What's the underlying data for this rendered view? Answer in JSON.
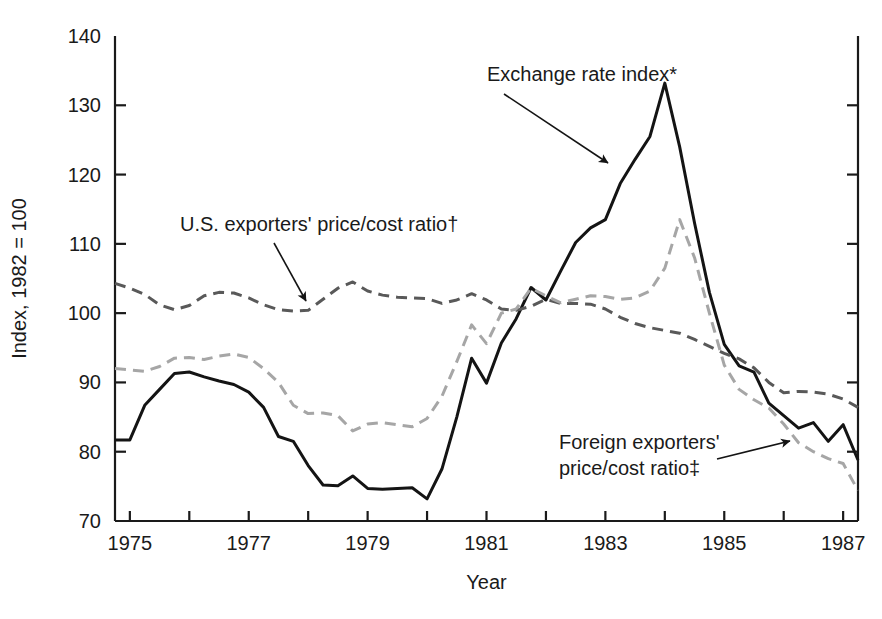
{
  "chart_data": {
    "type": "line",
    "title": "",
    "xlabel": "Year",
    "ylabel": "Index, 1982 = 100",
    "xlim": [
      1974.75,
      1987.25
    ],
    "ylim": [
      70,
      140
    ],
    "ytick_labels": [
      "140",
      "130",
      "120",
      "110",
      "100",
      "90",
      "80",
      "70"
    ],
    "ytick_values": [
      140,
      130,
      120,
      110,
      100,
      90,
      80,
      70
    ],
    "xtick_labels": [
      "1975",
      "1977",
      "1979",
      "1981",
      "1983",
      "1985",
      "1987"
    ],
    "xtick_values": [
      1975,
      1977,
      1979,
      1981,
      1983,
      1985,
      1987
    ],
    "xtick_minor_values": [
      1976,
      1978,
      1980,
      1982,
      1984,
      1986
    ],
    "grid": false,
    "legend_position": "annotations",
    "x": [
      1974.75,
      1975.0,
      1975.25,
      1975.5,
      1975.75,
      1976.0,
      1976.25,
      1976.5,
      1976.75,
      1977.0,
      1977.25,
      1977.5,
      1977.75,
      1978.0,
      1978.25,
      1978.5,
      1978.75,
      1979.0,
      1979.25,
      1979.5,
      1979.75,
      1980.0,
      1980.25,
      1980.5,
      1980.75,
      1981.0,
      1981.25,
      1981.5,
      1981.75,
      1982.0,
      1982.25,
      1982.5,
      1982.75,
      1983.0,
      1983.25,
      1983.5,
      1983.75,
      1984.0,
      1984.25,
      1984.5,
      1984.75,
      1985.0,
      1985.25,
      1985.5,
      1985.75,
      1986.0,
      1986.25,
      1986.5,
      1986.75,
      1987.0,
      1987.25
    ],
    "series": [
      {
        "name": "Exchange rate index*",
        "style": "solid",
        "color": "#141414",
        "values": [
          81.7,
          81.7,
          86.7,
          89.0,
          91.3,
          91.5,
          90.8,
          90.2,
          89.7,
          88.6,
          86.4,
          82.2,
          81.5,
          78.0,
          75.2,
          75.1,
          76.5,
          74.7,
          74.6,
          74.7,
          74.8,
          73.2,
          77.5,
          85.0,
          93.5,
          89.9,
          95.7,
          99.2,
          103.7,
          101.9,
          106.1,
          110.2,
          112.3,
          113.5,
          118.7,
          122.2,
          125.5,
          133.2,
          124.0,
          113.0,
          103.0,
          95.5,
          92.4,
          91.5,
          87.0,
          85.2,
          83.4,
          84.2,
          81.5,
          83.9,
          78.8
        ]
      },
      {
        "name": "U.S. exporters' price/cost ratio†",
        "style": "dashed",
        "color": "#595959",
        "values": [
          104.3,
          103.6,
          102.7,
          101.2,
          100.5,
          101.1,
          102.5,
          103.0,
          102.9,
          102.2,
          101.2,
          100.5,
          100.3,
          100.4,
          102.0,
          103.6,
          104.5,
          103.2,
          102.6,
          102.3,
          102.2,
          102.1,
          101.4,
          101.9,
          102.8,
          101.9,
          100.6,
          100.4,
          101.0,
          102.0,
          101.4,
          101.4,
          101.3,
          100.6,
          99.4,
          98.5,
          97.9,
          97.5,
          97.1,
          96.2,
          95.2,
          94.2,
          93.4,
          92.1,
          90.0,
          88.5,
          88.7,
          88.6,
          88.3,
          87.6,
          86.4
        ]
      },
      {
        "name": "Foreign exporters' price/cost ratio‡",
        "style": "dashed",
        "color": "#a6a6a6",
        "values": [
          92.0,
          91.8,
          91.6,
          92.3,
          93.5,
          93.6,
          93.3,
          93.8,
          94.1,
          93.6,
          92.0,
          90.0,
          86.7,
          85.5,
          85.6,
          85.2,
          83.0,
          84.0,
          84.2,
          83.9,
          83.6,
          84.8,
          88.0,
          93.0,
          98.3,
          95.6,
          100.0,
          100.6,
          103.6,
          102.5,
          101.5,
          102.0,
          102.5,
          102.4,
          102.0,
          102.2,
          103.2,
          106.5,
          113.5,
          108.0,
          100.0,
          92.5,
          89.0,
          87.5,
          86.3,
          84.0,
          81.3,
          80.0,
          79.0,
          78.3,
          74.4
        ]
      }
    ],
    "annotations": [
      {
        "id": "exchange-rate-index",
        "label": "Exchange rate index*",
        "text_x": 487,
        "text_y": 81,
        "arrow_from_x": 504,
        "arrow_from_y": 94,
        "arrow_to_x": 608,
        "arrow_to_y": 163
      },
      {
        "id": "us-exporters-price-cost-ratio",
        "label": "U.S. exporters' price/cost ratio†",
        "text_x": 180,
        "text_y": 231,
        "arrow_from_x": 274,
        "arrow_from_y": 243,
        "arrow_to_x": 306,
        "arrow_to_y": 301
      },
      {
        "id": "foreign-exporters-price-cost-ratio",
        "label_line1": "Foreign exporters'",
        "label_line2": "price/cost ratio‡",
        "text_x": 559,
        "text_y": 449,
        "arrow_from_x": 717,
        "arrow_from_y": 459,
        "arrow_to_x": 790,
        "arrow_to_y": 441
      }
    ]
  }
}
